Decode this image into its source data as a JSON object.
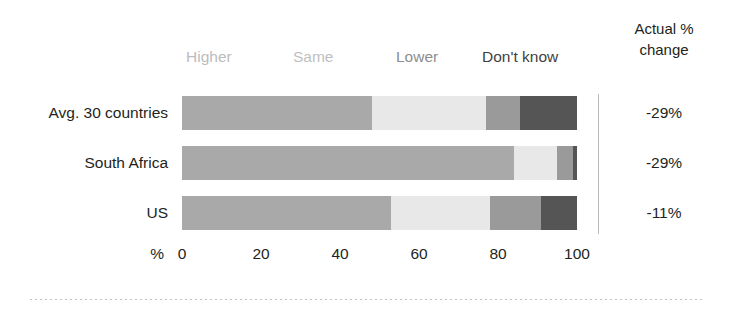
{
  "right_header": {
    "line1": "Actual %",
    "line2": "change"
  },
  "legend": {
    "higher": "Higher",
    "same": "Same",
    "lower": "Lower",
    "dont_know": "Don't know"
  },
  "axis": {
    "unit": "%",
    "ticks": [
      "0",
      "20",
      "40",
      "60",
      "80",
      "100"
    ]
  },
  "rows": [
    {
      "label": "Avg. 30 countries",
      "actual_change": "-29%"
    },
    {
      "label": "South Africa",
      "actual_change": "-29%"
    },
    {
      "label": "US",
      "actual_change": "-11%"
    }
  ],
  "chart_data": {
    "type": "bar",
    "subtype": "stacked-horizontal-100",
    "title": "",
    "xlabel": "%",
    "ylabel": "",
    "xlim": [
      0,
      100
    ],
    "grid": false,
    "legend_position": "top",
    "categories": [
      "Avg. 30 countries",
      "South Africa",
      "US"
    ],
    "series": [
      {
        "name": "Higher",
        "color": "#a9a9a9",
        "values": [
          48,
          84,
          53
        ]
      },
      {
        "name": "Same",
        "color": "#e8e8e8",
        "values": [
          29,
          11,
          25
        ]
      },
      {
        "name": "Lower",
        "color": "#9a9a9a",
        "values": [
          8.5,
          4,
          13
        ]
      },
      {
        "name": "Don't know",
        "color": "#555555",
        "values": [
          14.5,
          1,
          9
        ]
      }
    ],
    "annotations": {
      "column_header": "Actual % change",
      "column_values": [
        "-29%",
        "-29%",
        "-11%"
      ]
    },
    "xticks": [
      0,
      20,
      40,
      60,
      80,
      100
    ]
  },
  "colors": {
    "higher": "#a9a9a9",
    "same": "#e8e8e8",
    "lower": "#9a9a9a",
    "dont_know": "#555555",
    "text": "#231f20",
    "divider": "#b9b9b9"
  }
}
